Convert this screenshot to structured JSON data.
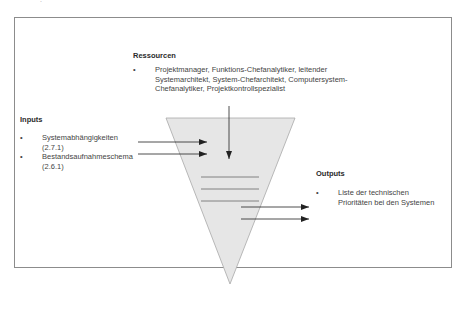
{
  "diagram": {
    "corner_mark": ".",
    "resources": {
      "heading": "Ressourcen",
      "items": [
        "Projektmanager, Funktions-Chefanalytiker, leitender Systemarchitekt, System-Chefarchitekt, Computersystem-Chefanalytiker, Projektkontrollspezialist"
      ]
    },
    "inputs": {
      "heading": "Inputs",
      "items": [
        {
          "line1": "Systemabhängigkeiten",
          "line2": "(2.7.1)"
        },
        {
          "line1": "Bestandsaufnahmeschema",
          "line2": "(2.6.1)"
        }
      ]
    },
    "outputs": {
      "heading": "Outputs",
      "items": [
        {
          "line1": "Liste der technischen",
          "line2": "Prioritäten bei den Systemen"
        }
      ]
    },
    "bullet_char": "•",
    "colors": {
      "funnel_fill": "#e6e6e6",
      "funnel_stroke": "#a8a8a8",
      "arrow": "#222222",
      "lines": "#777777",
      "frame": "#8c8c8c"
    }
  }
}
